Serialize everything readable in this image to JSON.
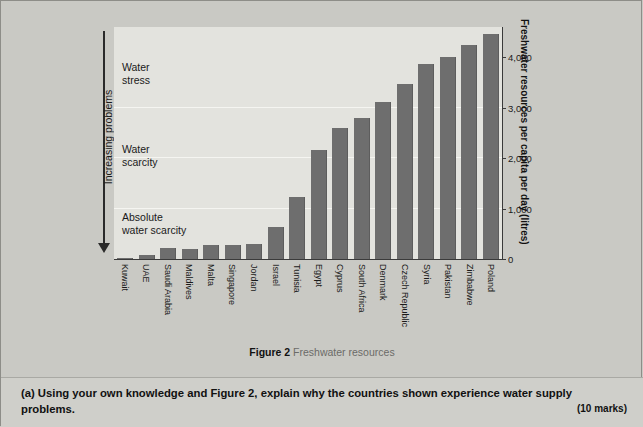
{
  "chart_data": {
    "type": "bar",
    "title": "Freshwater resources",
    "figure_number": "Figure 2",
    "xlabel": "",
    "ylabel": "Freshwater resources\nper capita per day (litres)",
    "ylim": [
      0,
      4600
    ],
    "yticks": [
      "0",
      "1,000",
      "2,000",
      "3,000",
      "4,000"
    ],
    "ytick_values": [
      0,
      1000,
      2000,
      3000,
      4000
    ],
    "grid": true,
    "legend": "none",
    "categories": [
      "Kuwait",
      "UAE",
      "Saudi Arabia",
      "Maldives",
      "Malta",
      "Singapore",
      "Jordan",
      "Israel",
      "Tunisia",
      "Egypt",
      "Cyprus",
      "South Africa",
      "Denmark",
      "Czech Republic",
      "Syria",
      "Pakistan",
      "Zimbabwe",
      "Poland"
    ],
    "values": [
      10,
      85,
      210,
      200,
      280,
      285,
      295,
      640,
      1220,
      2160,
      2600,
      2800,
      3110,
      3470,
      3860,
      4010,
      4250,
      4460
    ],
    "bar_color": "#6e6e6e",
    "plot_background": "#e3e3de"
  },
  "axis": {
    "left_arrow_label": "Increasing problems",
    "zones": [
      {
        "name": "water-stress",
        "label": "Water\nstress",
        "top_px": 60
      },
      {
        "name": "water-scarcity",
        "label": "Water\nscarcity",
        "top_px": 142
      },
      {
        "name": "absolute-water-scarcity",
        "label": "Absolute\nwater scarcity",
        "top_px": 210
      }
    ],
    "gridline_values": [
      1000,
      2000,
      3000
    ]
  },
  "caption": {
    "bold": "Figure 2",
    "rest": " Freshwater resources"
  },
  "question": {
    "label": "(a)",
    "text": "Using your own knowledge and Figure 2, explain why the countries shown experience water supply problems.",
    "marks": "(10 marks)"
  }
}
